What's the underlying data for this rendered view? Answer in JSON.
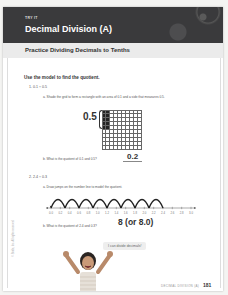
{
  "header": {
    "tag": "TRY IT",
    "title": "Decimal Division (A)"
  },
  "section": {
    "title": "Practice Dividing Decimals to Tenths"
  },
  "instruction": "Use the model to find the quotient.",
  "problem1": {
    "label": "1.  0.1 ÷ 0.5",
    "part_a": "a.  Shade the grid to form a rectangle with an area of 0.1 and a side that measures 0.5.",
    "side_label": "0.5",
    "grid": {
      "rows": 10,
      "cols": 10,
      "shaded_cols": 2,
      "shaded_rows": 5
    },
    "part_b": "b.  What is the quotient of 0.1 and 0.5?",
    "answer": "0.2"
  },
  "problem2": {
    "label": "2.  2.4 ÷ 0.3",
    "part_a": "a.  Draw jumps on the number line to model the quotient.",
    "number_line": {
      "ticks": [
        "0.0",
        "0.2",
        "0.4",
        "0.6",
        "0.8",
        "1.0",
        "1.2",
        "1.4",
        "1.6",
        "1.8",
        "2.0",
        "2.2",
        "2.4",
        "2.6",
        "2.8",
        "3.0"
      ],
      "jumps": 8,
      "jump_size": 0.3,
      "jump_start": 2.4,
      "jump_end": 0.0
    },
    "part_b": "b.  What is the quotient of 2.4 and 0.3?",
    "answer": "8 (or 8.0)"
  },
  "speech_bubble": "I can divide decimals!",
  "side_text": "© Stride, Inc. All rights reserved.",
  "footer": {
    "label": "DECIMAL DIVISION (A)",
    "page": "181"
  }
}
